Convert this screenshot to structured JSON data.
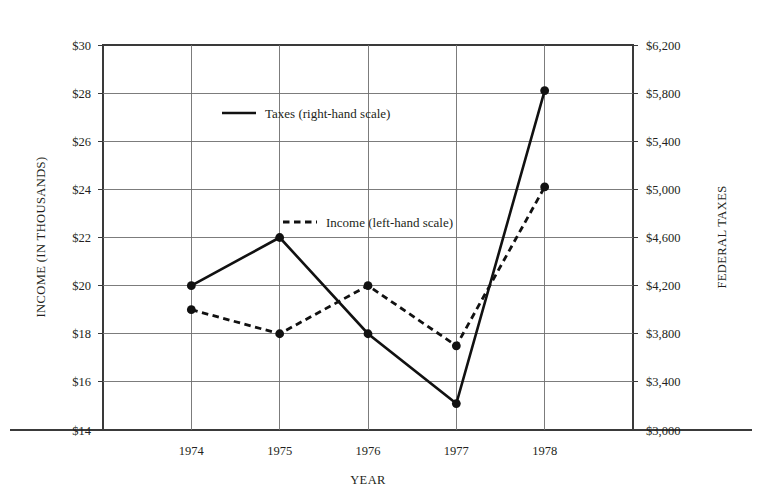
{
  "chart_data": {
    "type": "line",
    "title": "",
    "subtitle": "",
    "xlabel": "YEAR",
    "categories": [
      "1974",
      "1975",
      "1976",
      "1977",
      "1978"
    ],
    "x": [
      1974,
      1975,
      1976,
      1977,
      1978
    ],
    "grid": true,
    "legend_position": "inside-upper-center",
    "axes": {
      "left": {
        "label": "INCOME (IN THOUSANDS)",
        "ticks": [
          "$14",
          "$16",
          "$18",
          "$20",
          "$22",
          "$24",
          "$26",
          "$28",
          "$30"
        ],
        "tick_values": [
          14,
          16,
          18,
          20,
          22,
          24,
          26,
          28,
          30
        ],
        "min": 14,
        "max": 30,
        "step": 2,
        "prefix": "$"
      },
      "right": {
        "label": "FEDERAL TAXES",
        "ticks": [
          "$3,000",
          "$3,400",
          "$3,800",
          "$4,200",
          "$4,600",
          "$5,000",
          "$5,400",
          "$5,800",
          "$6,200"
        ],
        "tick_values": [
          3000,
          3400,
          3800,
          4200,
          4600,
          5000,
          5400,
          5800,
          6200
        ],
        "min": 3000,
        "max": 6200,
        "step": 400,
        "prefix": "$"
      }
    },
    "series": [
      {
        "name": "Taxes (right-hand scale)",
        "axis": "right",
        "style": "solid",
        "marker": "filled-circle",
        "color": "#111111",
        "values": [
          4200,
          4600,
          3800,
          3220,
          5820
        ]
      },
      {
        "name": "Income (left-hand scale)",
        "axis": "left",
        "style": "dashed",
        "marker": "filled-circle",
        "color": "#111111",
        "values": [
          19.0,
          18.0,
          20.0,
          17.5,
          24.1
        ]
      }
    ]
  },
  "legend": {
    "items": [
      {
        "label": "Taxes (right-hand scale)",
        "style": "solid"
      },
      {
        "label": "Income (left-hand scale)",
        "style": "dashed"
      }
    ]
  }
}
